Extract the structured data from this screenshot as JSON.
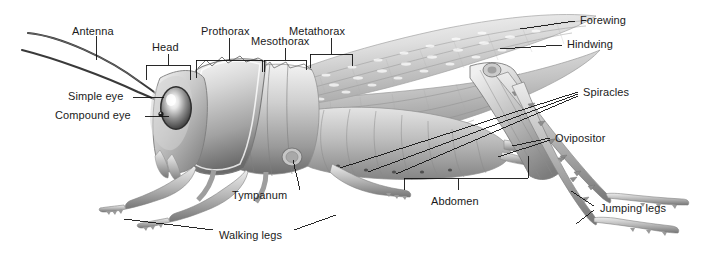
{
  "figure": {
    "background_color": "#ffffff",
    "label_color": "#1a1a1a",
    "leader_color": "#000000",
    "body_light": "#e8e8e8",
    "body_mid": "#b4b4b4",
    "body_dark": "#6e6e6e",
    "body_shadow": "#4a4a4a"
  },
  "labels": {
    "antenna": "Antenna",
    "head": "Head",
    "prothorax": "Prothorax",
    "mesothorax": "Mesothorax",
    "metathorax": "Metathorax",
    "forewing": "Forewing",
    "hindwing": "Hindwing",
    "simple_eye": "Simple eye",
    "compound_eye": "Compound eye",
    "spiracles": "Spiracles",
    "ovipositor": "Ovipositor",
    "tympanum": "Tympanum",
    "abdomen": "Abdomen",
    "walking_legs": "Walking legs",
    "jumping_legs": "Jumping legs"
  }
}
